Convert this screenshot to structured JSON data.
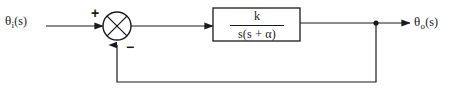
{
  "diagram": {
    "type": "block-diagram",
    "background_color": "#ffffff",
    "line_color": "#1a1a1a",
    "width": 454,
    "height": 95,
    "input": {
      "label_theta": "θ",
      "label_subscript": "i",
      "label_argument": "(s)",
      "full_label": "θi(s)"
    },
    "output": {
      "label_theta": "θ",
      "label_subscript": "o",
      "label_argument": "(s)",
      "full_label": "θo(s)"
    },
    "summing_junction": {
      "name": "summing-junction",
      "shape": "circle-with-cross",
      "positive_sign": "+",
      "negative_sign": "−",
      "center_x": 117,
      "center_y": 26,
      "radius": 14
    },
    "transfer_block": {
      "name": "transfer-function-block",
      "numerator": "k",
      "denominator": "s(s + α)",
      "full_expression": "k / s(s + α)",
      "x": 213,
      "y": 8,
      "width": 87,
      "height": 33
    },
    "takeoff_node": {
      "name": "feedback-takeoff-node",
      "x": 376,
      "y": 23
    },
    "feedback_path": {
      "name": "feedback-path",
      "direction": "negative",
      "bottom_y": 82
    }
  }
}
